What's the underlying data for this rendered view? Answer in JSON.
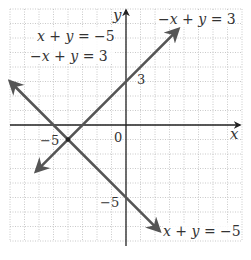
{
  "chart_data": {
    "type": "line",
    "title": "",
    "xlabel": "x",
    "ylabel": "y",
    "xlim": [
      -8,
      8
    ],
    "ylim": [
      -8,
      8
    ],
    "grid": true,
    "tick_labels": {
      "x": [
        "-5",
        "0"
      ],
      "y": [
        "3",
        "-5"
      ]
    },
    "series": [
      {
        "name": "x + y = -5",
        "equation": "x + y = -5",
        "slope": -1,
        "intercept": -5,
        "x": [
          -8,
          2.3
        ],
        "y": [
          3,
          -7.3
        ]
      },
      {
        "name": "-x + y = 3",
        "equation": "-x + y = 3",
        "slope": 1,
        "intercept": 3,
        "x": [
          -6.2,
          3.6
        ],
        "y": [
          -3.2,
          6.6
        ]
      }
    ],
    "intersection": {
      "x": -4,
      "y": -1
    },
    "annotations": {
      "system_line1": "x + y = −5",
      "system_line2": "−x + y = 3",
      "label_upper_right": "−x + y = 3",
      "label_lower_right": "x + y = −5"
    }
  },
  "labels": {
    "axis_x": "x",
    "axis_y": "y",
    "tick_x_neg5": "−5",
    "tick_origin": "0",
    "tick_y_3": "3",
    "tick_y_neg5": "−5",
    "system_eq1": "x + y = −5",
    "system_eq2": "−x + y = 3",
    "line_label_a": "−x + y = 3",
    "line_label_b": "x + y = −5"
  },
  "colors": {
    "grid": "#bbbbbb",
    "axes": "#222222",
    "lines": "#555555",
    "text": "#333333"
  }
}
